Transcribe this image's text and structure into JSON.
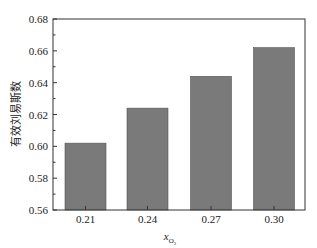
{
  "chart_data": {
    "type": "bar",
    "title": "",
    "xlabel": "x_O2",
    "xlabel_main": "x",
    "xlabel_sub": "O",
    "xlabel_subsub": "2",
    "ylabel": "有效刘易斯数",
    "categories": [
      "0.21",
      "0.24",
      "0.27",
      "0.30"
    ],
    "values": [
      0.602,
      0.624,
      0.644,
      0.662
    ],
    "ylim": [
      0.56,
      0.68
    ],
    "yticks": [
      "0.56",
      "0.58",
      "0.60",
      "0.62",
      "0.64",
      "0.66",
      "0.68"
    ],
    "grid": false,
    "legend": null,
    "bar_color": "#7a7a7a"
  }
}
